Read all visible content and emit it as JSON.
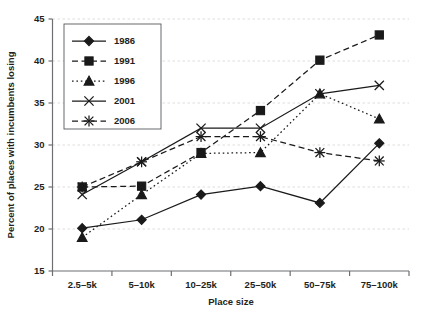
{
  "chart_data": {
    "type": "line",
    "title": "",
    "xlabel": "Place size",
    "ylabel": "Percent of places with incumbents losing",
    "categories": [
      "2.5–5k",
      "5–10k",
      "10–25k",
      "25–50k",
      "50–75k",
      "75–100k"
    ],
    "ylim": [
      15,
      45
    ],
    "yticks": [
      15,
      20,
      25,
      30,
      35,
      40,
      45
    ],
    "ytick_labels": [
      "15",
      "20",
      "25",
      "30",
      "35",
      "40",
      "45"
    ],
    "grid": true,
    "grid_axis": "y",
    "legend_position": "upper-left",
    "series": [
      {
        "name": "1986",
        "marker": "diamond",
        "linestyle": "solid",
        "values": [
          20.1,
          21.1,
          24.1,
          25.1,
          23.1,
          30.2
        ]
      },
      {
        "name": "1991",
        "marker": "square",
        "linestyle": "dashed",
        "values": [
          25.0,
          25.1,
          29.1,
          34.1,
          40.1,
          43.1
        ]
      },
      {
        "name": "1996",
        "marker": "triangle",
        "linestyle": "dotted",
        "values": [
          19.0,
          24.1,
          29.0,
          29.1,
          36.1,
          33.1
        ]
      },
      {
        "name": "2001",
        "marker": "x",
        "linestyle": "solid",
        "values": [
          24.1,
          28.0,
          32.0,
          32.0,
          36.1,
          37.1
        ]
      },
      {
        "name": "2006",
        "marker": "asterisk",
        "linestyle": "dashed",
        "values": [
          25.0,
          28.0,
          31.0,
          31.0,
          29.1,
          28.1
        ]
      }
    ]
  },
  "colors": {
    "ink": "#1a1a1a",
    "axis": "#6d6e71",
    "grid": "#d9d4d0",
    "background": "#ffffff"
  }
}
